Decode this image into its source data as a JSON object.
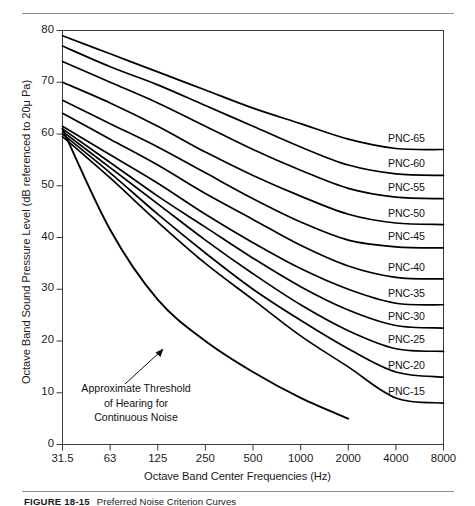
{
  "figure": {
    "caption_number": "FIGURE 18-15",
    "caption_text": "Preferred Noise Criterion Curves"
  },
  "chart_data": {
    "type": "line",
    "title": "",
    "xlabel": "Octave Band Center Frequencies (Hz)",
    "ylabel": "Octave Band Sound Pressure Level (dB referenced to 20μ Pa)",
    "x_scale": "log-octave",
    "x_tick_labels": [
      "31.5",
      "63",
      "125",
      "250",
      "500",
      "1000",
      "2000",
      "4000",
      "8000"
    ],
    "x_tick_values": [
      31.5,
      63,
      125,
      250,
      500,
      1000,
      2000,
      4000,
      8000
    ],
    "y_tick_labels": [
      "0",
      "10",
      "20",
      "30",
      "40",
      "50",
      "60",
      "70",
      "80"
    ],
    "y_tick_values": [
      0,
      10,
      20,
      30,
      40,
      50,
      60,
      70,
      80
    ],
    "ylim": [
      0,
      80
    ],
    "grid": false,
    "legend": "inline-right-labels",
    "line_color": "#000000",
    "series": [
      {
        "name": "PNC-65",
        "label": "PNC-65",
        "values": [
          79,
          75.5,
          72,
          68.5,
          65,
          62,
          59,
          57.2,
          57
        ]
      },
      {
        "name": "PNC-60",
        "label": "PNC-60",
        "values": [
          77,
          73,
          69.5,
          65.5,
          61.5,
          57.5,
          54,
          52.3,
          52
        ]
      },
      {
        "name": "PNC-55",
        "label": "PNC-55",
        "values": [
          74,
          70,
          66,
          61.5,
          57,
          53,
          49.5,
          47.8,
          47.5
        ]
      },
      {
        "name": "PNC-50",
        "label": "PNC-50",
        "values": [
          70,
          66,
          61.5,
          56.5,
          52,
          48,
          44.5,
          42.8,
          42.5
        ]
      },
      {
        "name": "PNC-45",
        "label": "PNC-45",
        "values": [
          66.5,
          62,
          57.5,
          52.5,
          47.5,
          43,
          39.5,
          38.2,
          38
        ]
      },
      {
        "name": "PNC-40",
        "label": "PNC-40",
        "values": [
          64,
          59,
          54,
          48.5,
          43.5,
          38.5,
          34.5,
          32.3,
          32
        ]
      },
      {
        "name": "PNC-35",
        "label": "PNC-35",
        "values": [
          61.5,
          56,
          50.5,
          44.5,
          39,
          34,
          30,
          27.3,
          27
        ]
      },
      {
        "name": "PNC-30",
        "label": "PNC-30",
        "values": [
          61,
          54.5,
          48,
          42,
          36,
          30.5,
          26,
          23,
          22.5
        ]
      },
      {
        "name": "PNC-25",
        "label": "PNC-25",
        "values": [
          60.5,
          53.5,
          46.5,
          39.5,
          33,
          27,
          22,
          18.5,
          18
        ]
      },
      {
        "name": "PNC-20",
        "label": "PNC-20",
        "values": [
          60,
          52.5,
          44.5,
          37,
          30,
          24,
          18.5,
          14,
          13
        ]
      },
      {
        "name": "PNC-15",
        "label": "PNC-15",
        "values": [
          59.5,
          51.5,
          43,
          35,
          28,
          21,
          15,
          9,
          8
        ]
      },
      {
        "name": "threshold-of-hearing",
        "label": "Approximate Threshold of Hearing for Continuous Noise",
        "values": [
          61,
          41.5,
          28,
          20,
          14,
          9,
          5,
          null,
          null
        ]
      }
    ],
    "annotation": {
      "line1": "Approximate Threshold",
      "line2": "of Hearing for",
      "line3": "Continuous Noise",
      "arrow": "arrow-up-right"
    }
  }
}
